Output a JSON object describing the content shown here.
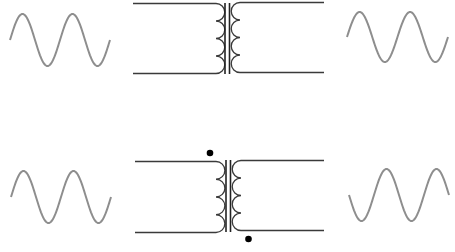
{
  "diagram": {
    "title": "",
    "colors": {
      "wire": "#3a3a3a",
      "core": "#222222",
      "waveform": "#8e8e8e",
      "dot": "#000000",
      "background": "#ffffff"
    },
    "rows": [
      {
        "id": "same-phase",
        "input_wave": {
          "cycles": 2,
          "phase": "in-phase"
        },
        "transformer": {
          "primary_turns_shown": 4,
          "secondary_turns_shown": 4,
          "core_lines": 2,
          "polarity_dots": "none"
        },
        "output_wave": {
          "cycles": 2,
          "phase": "in-phase"
        }
      },
      {
        "id": "inverted-phase",
        "input_wave": {
          "cycles": 2,
          "phase": "in-phase"
        },
        "transformer": {
          "primary_turns_shown": 4,
          "secondary_turns_shown": 4,
          "core_lines": 2,
          "polarity_dots": "primary-top, secondary-bottom"
        },
        "output_wave": {
          "cycles": 2,
          "phase": "inverted (180°)"
        }
      }
    ]
  }
}
